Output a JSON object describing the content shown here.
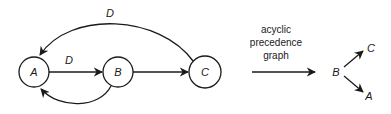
{
  "diagram": {
    "left_graph": {
      "nodes": [
        {
          "id": "A",
          "label": "A"
        },
        {
          "id": "B",
          "label": "B"
        },
        {
          "id": "C",
          "label": "C"
        }
      ],
      "edges": [
        {
          "from": "A",
          "to": "B",
          "label": "D"
        },
        {
          "from": "B",
          "to": "C",
          "label": ""
        },
        {
          "from": "C",
          "to": "A",
          "label": "D"
        },
        {
          "from": "B",
          "to": "A",
          "label": ""
        }
      ]
    },
    "transform_caption": [
      "acyclic",
      "precedence",
      "graph"
    ],
    "right_graph": {
      "nodes": [
        {
          "id": "B",
          "label": "B"
        },
        {
          "id": "C",
          "label": "C"
        },
        {
          "id": "A",
          "label": "A"
        }
      ],
      "edges": [
        {
          "from": "B",
          "to": "C"
        },
        {
          "from": "B",
          "to": "A"
        }
      ]
    },
    "colors": {
      "ink": "#1a1a1a",
      "background": "#ffffff"
    }
  }
}
